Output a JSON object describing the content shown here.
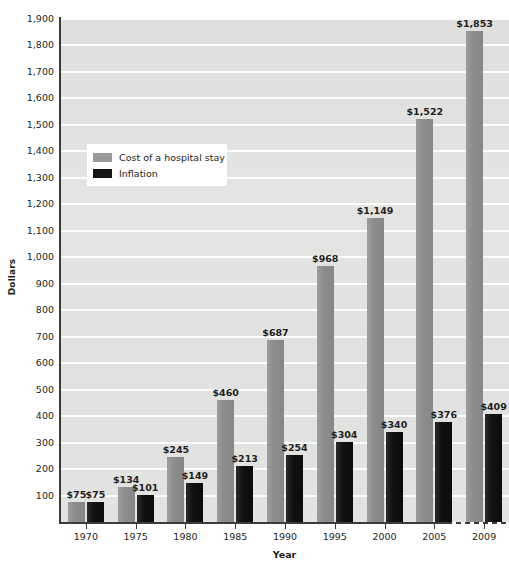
{
  "chart_data": {
    "type": "bar",
    "title": "",
    "xlabel": "Year",
    "ylabel": "Dollars",
    "categories": [
      "1970",
      "1975",
      "1980",
      "1985",
      "1990",
      "1995",
      "2000",
      "2005",
      "2009"
    ],
    "series": [
      {
        "name": "Cost of a hospital stay",
        "color": "#8c8c8c",
        "values": [
          75,
          134,
          245,
          460,
          687,
          968,
          1149,
          1522,
          1853
        ],
        "labels": [
          "$75",
          "$134",
          "$245",
          "$460",
          "$687",
          "$968",
          "$1,149",
          "$1,522",
          "$1,853"
        ]
      },
      {
        "name": "Inflation",
        "color": "#111111",
        "values": [
          75,
          101,
          149,
          213,
          254,
          304,
          340,
          376,
          409
        ],
        "labels": [
          "$75",
          "$101",
          "$149",
          "$213",
          "$254",
          "$304",
          "$340",
          "$376",
          "$409"
        ]
      }
    ],
    "ylim": [
      0,
      1900
    ],
    "ytick_step": 100,
    "ytick_labels": [
      "100",
      "200",
      "300",
      "400",
      "500",
      "600",
      "700",
      "800",
      "900",
      "1,000",
      "1,100",
      "1,200",
      "1,300",
      "1,400",
      "1,500",
      "1,600",
      "1,700",
      "1,800",
      "1,900"
    ],
    "ytick_values": [
      100,
      200,
      300,
      400,
      500,
      600,
      700,
      800,
      900,
      1000,
      1100,
      1200,
      1300,
      1400,
      1500,
      1600,
      1700,
      1800,
      1900
    ],
    "grid": true,
    "legend_position": "inside-upper-left",
    "plot_background": "#e2e2e2",
    "gridline_color": "#ffffff",
    "axis_color": "#3b3b3b"
  },
  "legend": {
    "items": [
      {
        "label": "Cost of a hospital stay",
        "swatch": "cost"
      },
      {
        "label": "Inflation",
        "swatch": "inflation"
      }
    ]
  },
  "axes": {
    "y_title": "Dollars",
    "x_title": "Year"
  }
}
